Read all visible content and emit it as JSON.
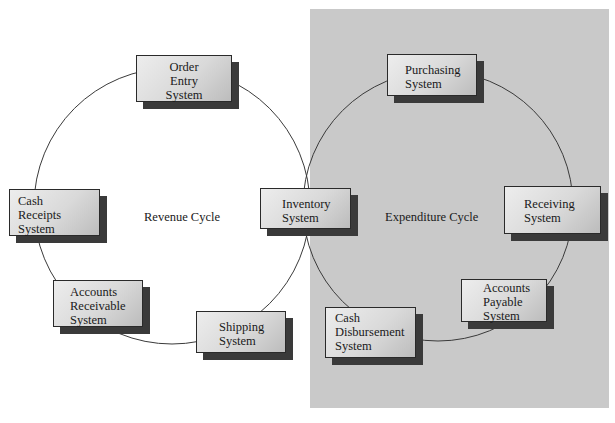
{
  "diagram": {
    "revenue_cycle": {
      "label": "Revenue Cycle",
      "nodes": [
        {
          "lines": [
            "Order",
            "Entry",
            "System"
          ]
        },
        {
          "lines": [
            "Cash",
            "Receipts",
            "System"
          ]
        },
        {
          "lines": [
            "Accounts",
            "Receivable",
            "System"
          ]
        },
        {
          "lines": [
            "Shipping",
            "System"
          ]
        }
      ]
    },
    "shared_node": {
      "lines": [
        "Inventory",
        "System"
      ]
    },
    "expenditure_cycle": {
      "label": "Expenditure Cycle",
      "nodes": [
        {
          "lines": [
            "Purchasing",
            "System"
          ]
        },
        {
          "lines": [
            "Receiving",
            "System"
          ]
        },
        {
          "lines": [
            "Accounts",
            "Payable",
            "System"
          ]
        },
        {
          "lines": [
            "Cash",
            "Disbursement",
            "System"
          ]
        }
      ]
    },
    "colors": {
      "expenditure_panel": "#c9c9c9",
      "box_shadow": "#3a3a3a",
      "cycle_line": "#3a3a3a"
    }
  }
}
